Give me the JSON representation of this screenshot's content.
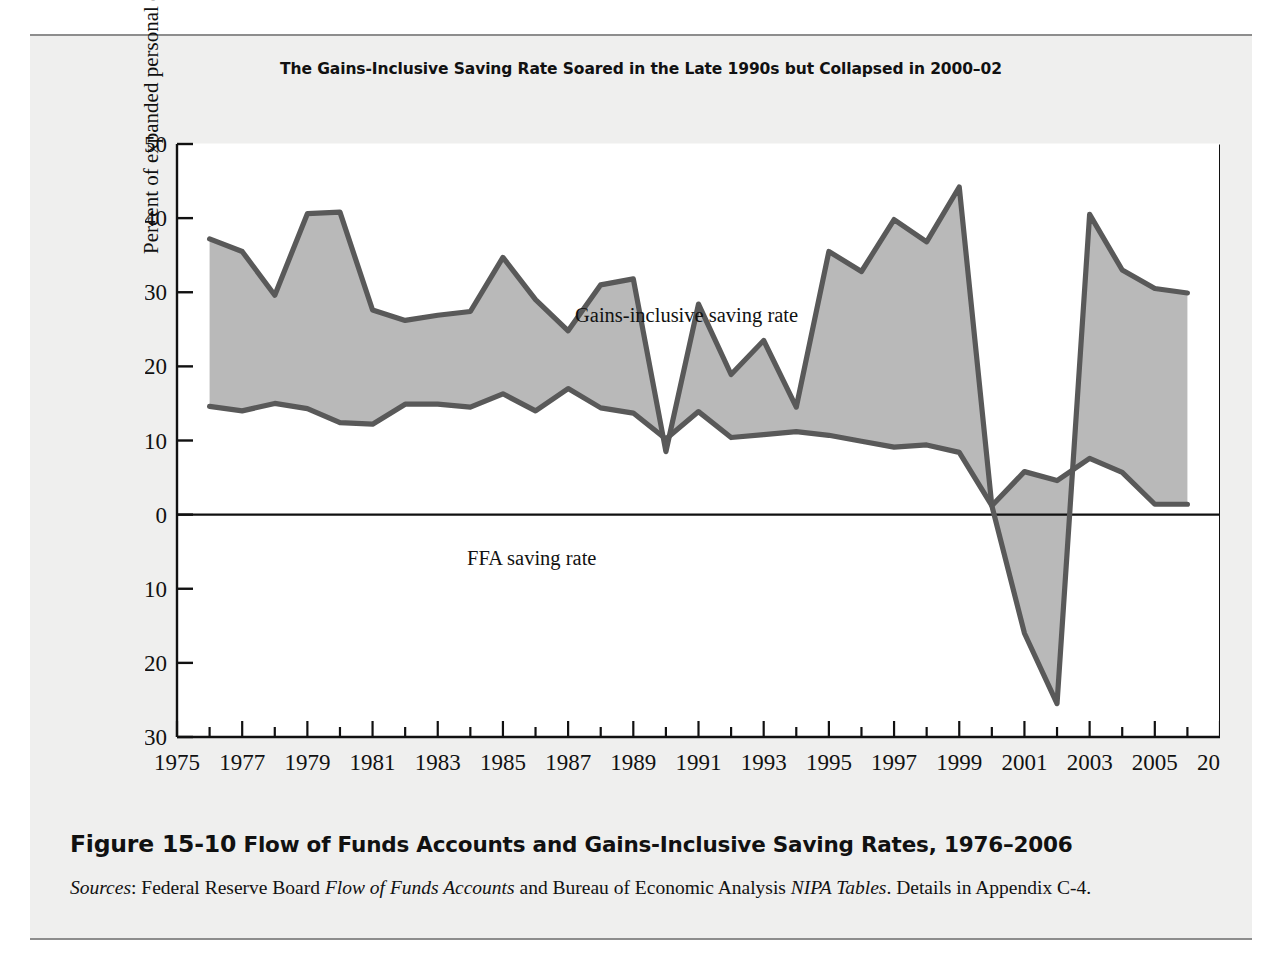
{
  "figure": {
    "chart_title": "The Gains-Inclusive Saving Rate Soared in the Late 1990s but Collapsed in 2000–02",
    "caption_figure_number": "Figure 15-10",
    "caption_title": " Flow of Funds Accounts and Gains-Inclusive Saving Rates, 1976–2006",
    "sources_label": "Sources",
    "sources_text_1": ": Federal Reserve Board ",
    "sources_italic_1": "Flow of Funds Accounts",
    "sources_text_2": " and Bureau of Economic Analysis ",
    "sources_italic_2": "NIPA Tables",
    "sources_text_3": ". Details in Appendix C-4."
  },
  "chart_data": {
    "type": "area",
    "title": "The Gains-Inclusive Saving Rate Soared in the Late 1990s but Collapsed in 2000–02",
    "xlabel": "",
    "ylabel": "Percent of expanded personal disposable income",
    "xlim": [
      1975,
      2007
    ],
    "ylim": [
      -30,
      50
    ],
    "ytick_step": 10,
    "xtick_step": 2,
    "xticks": [
      1975,
      1977,
      1979,
      1981,
      1983,
      1985,
      1987,
      1989,
      1991,
      1993,
      1995,
      1997,
      1999,
      2001,
      2003,
      2005,
      2007
    ],
    "yticks": [
      -30,
      -20,
      -10,
      0,
      10,
      20,
      30,
      40,
      50
    ],
    "minor_xticks_every": 1,
    "grid": false,
    "legend_position": "inline-annotations",
    "zero_line": true,
    "fill_between": true,
    "fill_color": "#b9b9b9",
    "line_color": "#595959",
    "x": [
      1976,
      1977,
      1978,
      1979,
      1980,
      1981,
      1982,
      1983,
      1984,
      1985,
      1986,
      1987,
      1988,
      1989,
      1990,
      1991,
      1992,
      1993,
      1994,
      1995,
      1996,
      1997,
      1998,
      1999,
      2000,
      2001,
      2002,
      2003,
      2004,
      2005,
      2006
    ],
    "series": [
      {
        "name": "Gains-inclusive saving rate",
        "label": "Gains-inclusive saving rate",
        "values": [
          37.2,
          35.5,
          29.6,
          40.6,
          40.8,
          27.6,
          26.2,
          26.9,
          27.4,
          34.7,
          29.0,
          24.8,
          31.0,
          31.8,
          8.5,
          28.4,
          18.9,
          23.5,
          14.5,
          35.5,
          32.8,
          39.8,
          36.8,
          44.2,
          1.2,
          -16.0,
          -25.5,
          40.5,
          33.0,
          30.5,
          29.9
        ]
      },
      {
        "name": "FFA saving rate",
        "label": "FFA saving rate",
        "values": [
          14.6,
          14.0,
          15.0,
          14.3,
          12.4,
          12.2,
          14.9,
          14.9,
          14.5,
          16.3,
          14.0,
          17.0,
          14.4,
          13.7,
          10.2,
          13.9,
          10.4,
          10.8,
          11.2,
          10.7,
          9.9,
          9.1,
          9.4,
          8.4,
          1.2,
          5.8,
          4.6,
          7.6,
          5.7,
          1.4,
          1.4
        ]
      }
    ],
    "annotations": [
      {
        "text": "Gains-inclusive saving rate",
        "x": 1984.5,
        "y": 39.5
      },
      {
        "text": "FFA saving rate",
        "x": 1981.5,
        "y": 6.5
      }
    ]
  }
}
